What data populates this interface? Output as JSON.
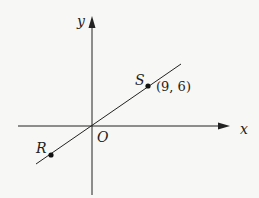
{
  "diagram": {
    "type": "coordinate-plane",
    "axes": {
      "x_label": "x",
      "y_label": "y",
      "origin_label": "O"
    },
    "line": {
      "description": "line through origin",
      "passes_through": [
        "O",
        "R",
        "S"
      ]
    },
    "points": [
      {
        "name": "S",
        "coords_label": "(9, 6)",
        "x": 9,
        "y": 6
      },
      {
        "name": "R",
        "coords_label": ""
      }
    ],
    "colors": {
      "background": "#f7f7f5",
      "ink": "#222222"
    }
  }
}
